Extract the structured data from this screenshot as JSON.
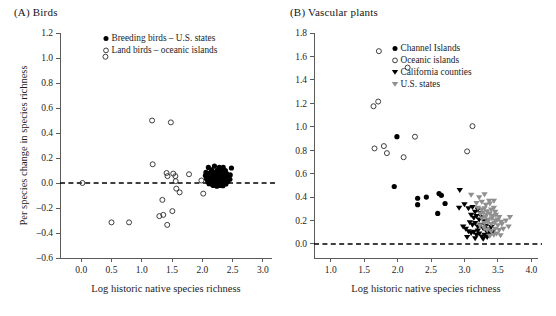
{
  "figure": {
    "panels": [
      {
        "id": "A",
        "label": "(A)",
        "title": "Birds",
        "title_full": "(A)  Birds",
        "xlabel": "Log historic native species richness",
        "ylabel": "Per species change in species richness",
        "xlim": [
          -0.35,
          3.15
        ],
        "ylim": [
          -0.6,
          1.2
        ],
        "xticks": [
          "0.0",
          "0.5",
          "1.0",
          "1.5",
          "2.0",
          "2.5",
          "3.0"
        ],
        "xtick_values": [
          0.0,
          0.5,
          1.0,
          1.5,
          2.0,
          2.5,
          3.0
        ],
        "yticks": [
          "1.2",
          "1.0",
          "0.8",
          "0.6",
          "0.4",
          "0.2",
          "0.0",
          "-0.2",
          "-0.4",
          "-0.6"
        ],
        "ytick_values": [
          1.2,
          1.0,
          0.8,
          0.6,
          0.4,
          0.2,
          0.0,
          -0.2,
          -0.4,
          -0.6
        ],
        "reference_line": {
          "y": 0.0,
          "style": "dashed"
        },
        "legend": [
          {
            "marker": "filled-circle",
            "label": "Breeding birds – U.S. states"
          },
          {
            "marker": "open-circle",
            "label": "Land birds – oceanic islands"
          }
        ]
      },
      {
        "id": "B",
        "label": "(B)",
        "title": "Vascular plants",
        "title_full": "(B)  Vascular plants",
        "xlabel": "Log historic native species richness",
        "ylabel": "",
        "xlim": [
          0.75,
          4.1
        ],
        "ylim": [
          -0.12,
          1.8
        ],
        "xticks": [
          "1.0",
          "1.5",
          "2.0",
          "2.5",
          "3.0",
          "3.5",
          "4.0"
        ],
        "xtick_values": [
          1.0,
          1.5,
          2.0,
          2.5,
          3.0,
          3.5,
          4.0
        ],
        "yticks": [
          "1.8",
          "1.6",
          "1.4",
          "1.2",
          "1.0",
          "0.8",
          "0.6",
          "0.4",
          "0.2",
          "0.0"
        ],
        "ytick_values": [
          1.8,
          1.6,
          1.4,
          1.2,
          1.0,
          0.8,
          0.6,
          0.4,
          0.2,
          0.0
        ],
        "reference_line": {
          "y": 0.0,
          "style": "dashed"
        },
        "legend": [
          {
            "marker": "filled-circle",
            "label": "Channel Islands"
          },
          {
            "marker": "open-circle",
            "label": "Oceanic islands"
          },
          {
            "marker": "black-triangle-down",
            "label": "California counties"
          },
          {
            "marker": "gray-triangle-down",
            "label": "U.S. states"
          }
        ]
      }
    ]
  },
  "colors": {
    "filled_marker": "#000000",
    "open_marker_stroke": "#2a2a2a",
    "gray_triangle": "#8f8f8f",
    "axis": "#5b5b5b",
    "text": "#1d1d1d",
    "background": "#ffffff"
  },
  "chart_data": [
    {
      "type": "scatter",
      "panel": "A",
      "title": "(A) Birds",
      "xlabel": "Log historic native species richness",
      "ylabel": "Per species change in species richness",
      "xlim": [
        -0.35,
        3.15
      ],
      "ylim": [
        -0.6,
        1.2
      ],
      "grid": false,
      "legend_position": "upper-right-inside",
      "annotations": [
        {
          "type": "hline",
          "y": 0.0,
          "style": "dashed"
        }
      ],
      "series": [
        {
          "name": "Land birds – oceanic islands",
          "marker": "open-circle",
          "points": [
            [
              0.4,
              1.01
            ],
            [
              1.17,
              0.5
            ],
            [
              1.48,
              0.485
            ],
            [
              0.02,
              0.0
            ],
            [
              1.18,
              0.15
            ],
            [
              1.41,
              0.08
            ],
            [
              1.425,
              0.055
            ],
            [
              1.52,
              0.075
            ],
            [
              1.555,
              0.055
            ],
            [
              1.56,
              0.015
            ],
            [
              1.57,
              -0.045
            ],
            [
              1.78,
              0.07
            ],
            [
              1.985,
              0.02
            ],
            [
              1.625,
              -0.075
            ],
            [
              2.015,
              -0.085
            ],
            [
              1.34,
              -0.135
            ],
            [
              1.505,
              -0.225
            ],
            [
              1.29,
              -0.265
            ],
            [
              1.355,
              -0.255
            ],
            [
              0.5,
              -0.315
            ],
            [
              0.79,
              -0.315
            ],
            [
              1.42,
              -0.335
            ]
          ]
        },
        {
          "name": "Breeding birds – U.S. states",
          "marker": "filled-circle",
          "points": [
            [
              2.1,
              0.125
            ],
            [
              2.2,
              0.135
            ],
            [
              2.28,
              0.125
            ],
            [
              2.345,
              0.125
            ],
            [
              2.48,
              0.12
            ],
            [
              2.15,
              0.105
            ],
            [
              2.24,
              0.1
            ],
            [
              2.31,
              0.095
            ],
            [
              2.38,
              0.1
            ],
            [
              2.06,
              0.085
            ],
            [
              2.12,
              0.08
            ],
            [
              2.18,
              0.085
            ],
            [
              2.23,
              0.075
            ],
            [
              2.285,
              0.08
            ],
            [
              2.33,
              0.07
            ],
            [
              2.4,
              0.075
            ],
            [
              2.05,
              0.06
            ],
            [
              2.1,
              0.055
            ],
            [
              2.155,
              0.06
            ],
            [
              2.2,
              0.05
            ],
            [
              2.245,
              0.055
            ],
            [
              2.29,
              0.045
            ],
            [
              2.335,
              0.05
            ],
            [
              2.38,
              0.04
            ],
            [
              2.43,
              0.05
            ],
            [
              2.07,
              0.035
            ],
            [
              2.12,
              0.03
            ],
            [
              2.17,
              0.035
            ],
            [
              2.215,
              0.025
            ],
            [
              2.26,
              0.03
            ],
            [
              2.305,
              0.02
            ],
            [
              2.35,
              0.03
            ],
            [
              2.4,
              0.02
            ],
            [
              2.09,
              0.012
            ],
            [
              2.14,
              0.008
            ],
            [
              2.19,
              0.015
            ],
            [
              2.235,
              0.005
            ],
            [
              2.28,
              0.01
            ],
            [
              2.325,
              0.0
            ],
            [
              2.37,
              0.008
            ],
            [
              2.42,
              0.012
            ],
            [
              2.11,
              -0.005
            ],
            [
              2.16,
              -0.01
            ],
            [
              2.21,
              -0.008
            ],
            [
              2.26,
              -0.012
            ],
            [
              2.3,
              -0.005
            ],
            [
              2.345,
              -0.01
            ],
            [
              2.39,
              -0.008
            ],
            [
              2.18,
              -0.02
            ],
            [
              2.24,
              -0.025
            ],
            [
              2.29,
              -0.02
            ],
            [
              2.34,
              -0.022
            ],
            [
              2.455,
              0.03
            ],
            [
              2.46,
              0.065
            ]
          ]
        }
      ]
    },
    {
      "type": "scatter",
      "panel": "B",
      "title": "(B) Vascular plants",
      "xlabel": "Log historic native species richness",
      "ylabel": "",
      "xlim": [
        0.75,
        4.1
      ],
      "ylim": [
        -0.12,
        1.8
      ],
      "grid": false,
      "legend_position": "upper-right-inside",
      "annotations": [
        {
          "type": "hline",
          "y": 0.0,
          "style": "dashed"
        }
      ],
      "series": [
        {
          "name": "Oceanic islands",
          "marker": "open-circle",
          "points": [
            [
              1.72,
              1.645
            ],
            [
              2.15,
              1.505
            ],
            [
              1.64,
              1.175
            ],
            [
              1.71,
              1.215
            ],
            [
              3.12,
              1.005
            ],
            [
              2.26,
              0.915
            ],
            [
              1.655,
              0.815
            ],
            [
              1.795,
              0.835
            ],
            [
              1.84,
              0.775
            ],
            [
              3.04,
              0.79
            ],
            [
              2.09,
              0.74
            ]
          ]
        },
        {
          "name": "Channel Islands",
          "marker": "filled-circle",
          "points": [
            [
              1.99,
              0.915
            ],
            [
              1.95,
              0.49
            ],
            [
              2.3,
              0.39
            ],
            [
              2.43,
              0.4
            ],
            [
              2.62,
              0.43
            ],
            [
              2.655,
              0.415
            ],
            [
              2.3,
              0.335
            ],
            [
              2.71,
              0.345
            ],
            [
              2.6,
              0.26
            ]
          ]
        },
        {
          "name": "California counties",
          "marker": "black-triangle-down",
          "points": [
            [
              2.93,
              0.455
            ],
            [
              2.92,
              0.305
            ],
            [
              3.0,
              0.335
            ],
            [
              3.06,
              0.3
            ],
            [
              3.12,
              0.31
            ],
            [
              3.16,
              0.27
            ],
            [
              3.2,
              0.29
            ],
            [
              3.24,
              0.26
            ],
            [
              3.1,
              0.245
            ],
            [
              3.14,
              0.22
            ],
            [
              3.18,
              0.235
            ],
            [
              3.22,
              0.205
            ],
            [
              3.26,
              0.225
            ],
            [
              3.3,
              0.19
            ],
            [
              3.08,
              0.18
            ],
            [
              3.12,
              0.16
            ],
            [
              3.16,
              0.175
            ],
            [
              3.2,
              0.145
            ],
            [
              3.24,
              0.16
            ],
            [
              3.28,
              0.13
            ],
            [
              3.32,
              0.15
            ],
            [
              2.98,
              0.145
            ],
            [
              3.02,
              0.125
            ],
            [
              3.06,
              0.105
            ],
            [
              3.1,
              0.09
            ],
            [
              3.14,
              0.1
            ],
            [
              3.18,
              0.075
            ],
            [
              3.22,
              0.085
            ],
            [
              3.26,
              0.06
            ],
            [
              3.3,
              0.075
            ],
            [
              3.34,
              0.055
            ],
            [
              3.38,
              0.08
            ],
            [
              3.04,
              0.055
            ],
            [
              3.16,
              0.045
            ],
            [
              3.28,
              0.04
            ],
            [
              3.36,
              0.12
            ],
            [
              3.4,
              0.14
            ],
            [
              3.34,
              0.095
            ],
            [
              3.42,
              0.1
            ],
            [
              3.2,
              0.11
            ]
          ]
        },
        {
          "name": "U.S. states",
          "marker": "gray-triangle-down",
          "points": [
            [
              3.1,
              0.415
            ],
            [
              3.22,
              0.395
            ],
            [
              3.3,
              0.42
            ],
            [
              3.37,
              0.365
            ],
            [
              3.44,
              0.365
            ],
            [
              3.18,
              0.345
            ],
            [
              3.26,
              0.355
            ],
            [
              3.32,
              0.33
            ],
            [
              3.38,
              0.34
            ],
            [
              3.44,
              0.305
            ],
            [
              3.2,
              0.305
            ],
            [
              3.26,
              0.29
            ],
            [
              3.3,
              0.3
            ],
            [
              3.34,
              0.275
            ],
            [
              3.4,
              0.29
            ],
            [
              3.46,
              0.27
            ],
            [
              3.24,
              0.255
            ],
            [
              3.28,
              0.265
            ],
            [
              3.33,
              0.245
            ],
            [
              3.38,
              0.255
            ],
            [
              3.42,
              0.235
            ],
            [
              3.47,
              0.245
            ],
            [
              3.52,
              0.225
            ],
            [
              3.26,
              0.215
            ],
            [
              3.31,
              0.225
            ],
            [
              3.36,
              0.205
            ],
            [
              3.41,
              0.215
            ],
            [
              3.46,
              0.195
            ],
            [
              3.5,
              0.205
            ],
            [
              3.55,
              0.185
            ],
            [
              3.3,
              0.175
            ],
            [
              3.35,
              0.185
            ],
            [
              3.4,
              0.165
            ],
            [
              3.45,
              0.175
            ],
            [
              3.5,
              0.155
            ],
            [
              3.56,
              0.165
            ],
            [
              3.62,
              0.195
            ],
            [
              3.68,
              0.225
            ],
            [
              3.66,
              0.145
            ],
            [
              3.58,
              0.125
            ],
            [
              3.52,
              0.115
            ],
            [
              3.46,
              0.125
            ],
            [
              3.4,
              0.105
            ],
            [
              3.34,
              0.115
            ],
            [
              3.44,
              0.075
            ],
            [
              3.38,
              0.065
            ],
            [
              3.48,
              0.085
            ],
            [
              3.54,
              0.07
            ],
            [
              3.29,
              0.135
            ],
            [
              3.23,
              0.155
            ]
          ]
        }
      ]
    }
  ]
}
